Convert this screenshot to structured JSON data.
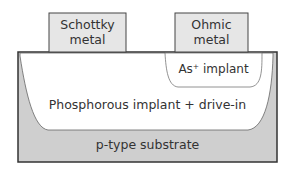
{
  "diagram": {
    "schottky_metal": {
      "line1": "Schottky",
      "line2": "metal"
    },
    "ohmic_metal": {
      "line1": "Ohmic",
      "line2": "metal"
    },
    "as_implant": "As⁺ implant",
    "phosphorous": "Phosphorous implant + drive-in",
    "substrate": "p-type substrate",
    "colors": {
      "substrate": "#cfcfcf",
      "metal": "#e6e6e6",
      "implant": "#ffffff",
      "outline": "#444444"
    }
  }
}
